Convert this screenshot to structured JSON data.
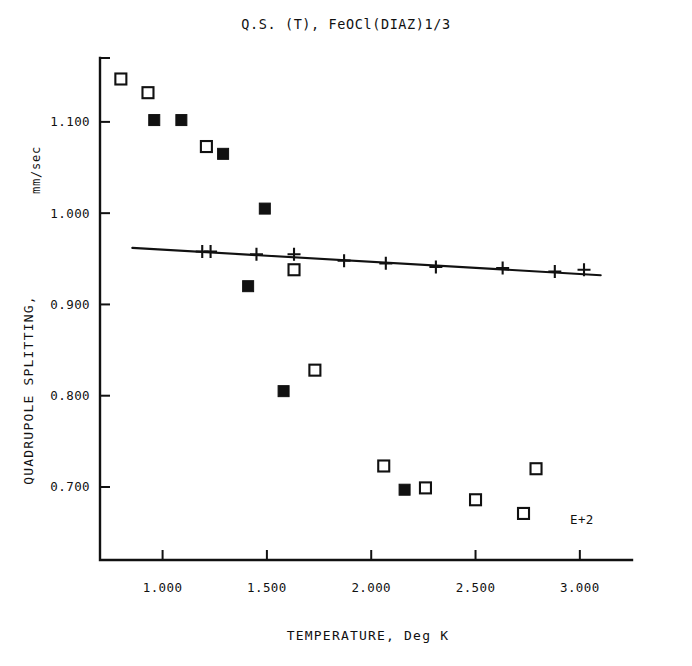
{
  "chart_data": {
    "type": "scatter",
    "title": "Q.S. (T), FeOCl(DIAZ)1/3",
    "xlabel": "TEMPERATURE, Deg K",
    "ylabel": "QUADRUPOLE SPLITTING,",
    "yunit": "mm/sec",
    "exponent_label": "E+2",
    "grid": false,
    "legend": "none",
    "xlim": [
      0.7,
      3.25
    ],
    "ylim": [
      0.62,
      1.17
    ],
    "xticks": [
      1.0,
      1.5,
      2.0,
      2.5,
      3.0
    ],
    "xtick_labels": [
      "1.000",
      "1.500",
      "2.000",
      "2.500",
      "3.000"
    ],
    "yticks": [
      0.7,
      0.8,
      0.9,
      1.0,
      1.1
    ],
    "ytick_labels": [
      "0.700",
      "0.800",
      "0.900",
      "1.000",
      "1.100"
    ],
    "series": [
      {
        "name": "open-square",
        "marker": "open-square",
        "color": "#111111",
        "points": [
          {
            "x": 0.8,
            "y": 1.147
          },
          {
            "x": 0.93,
            "y": 1.132
          },
          {
            "x": 1.21,
            "y": 1.073
          },
          {
            "x": 1.63,
            "y": 0.938
          },
          {
            "x": 1.73,
            "y": 0.828
          },
          {
            "x": 2.06,
            "y": 0.723
          },
          {
            "x": 2.26,
            "y": 0.699
          },
          {
            "x": 2.5,
            "y": 0.686
          },
          {
            "x": 2.73,
            "y": 0.671
          },
          {
            "x": 2.79,
            "y": 0.72
          }
        ]
      },
      {
        "name": "filled-square",
        "marker": "filled-square",
        "color": "#111111",
        "points": [
          {
            "x": 0.96,
            "y": 1.102
          },
          {
            "x": 1.09,
            "y": 1.102
          },
          {
            "x": 1.29,
            "y": 1.065
          },
          {
            "x": 1.49,
            "y": 1.005
          },
          {
            "x": 1.41,
            "y": 0.92
          },
          {
            "x": 1.58,
            "y": 0.805
          },
          {
            "x": 2.16,
            "y": 0.697
          }
        ]
      },
      {
        "name": "plus",
        "marker": "plus",
        "color": "#111111",
        "points": [
          {
            "x": 1.19,
            "y": 0.958
          },
          {
            "x": 1.23,
            "y": 0.958
          },
          {
            "x": 1.45,
            "y": 0.955
          },
          {
            "x": 1.63,
            "y": 0.955
          },
          {
            "x": 1.87,
            "y": 0.948
          },
          {
            "x": 2.07,
            "y": 0.945
          },
          {
            "x": 2.31,
            "y": 0.941
          },
          {
            "x": 2.63,
            "y": 0.94
          },
          {
            "x": 2.88,
            "y": 0.936
          },
          {
            "x": 3.02,
            "y": 0.938
          }
        ]
      }
    ],
    "fit_line": {
      "name": "linear-fit",
      "x0": 0.855,
      "y0": 0.962,
      "x1": 3.1,
      "y1": 0.932
    }
  }
}
